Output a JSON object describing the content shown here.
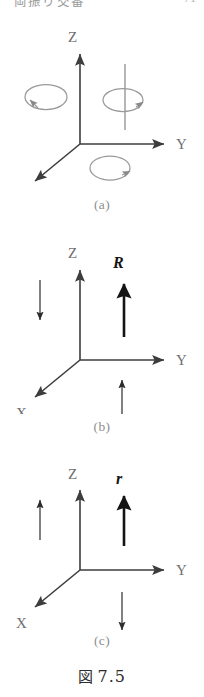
{
  "header": {
    "running_title": "両振り交番",
    "page_number": "71"
  },
  "figure": {
    "number_kanji": "図",
    "number": "7.5",
    "panels": [
      {
        "id": "a",
        "caption": "(a)",
        "axes": [
          {
            "name": "z-axis",
            "label": "Z",
            "direction": "up"
          },
          {
            "name": "y-axis",
            "label": "Y",
            "direction": "right"
          },
          {
            "name": "x-axis",
            "label": "X",
            "direction": "down-left"
          }
        ],
        "annotations": [
          {
            "name": "rotation-arrow-x",
            "glyph": "rotation-ellipse",
            "position": "left"
          },
          {
            "name": "rotation-arrow-z",
            "glyph": "rotation-ellipse-about-line",
            "position": "center"
          },
          {
            "name": "rotation-arrow-y",
            "glyph": "rotation-ellipse",
            "position": "below"
          }
        ]
      },
      {
        "id": "b",
        "caption": "(b)",
        "axes": [
          {
            "name": "z-axis",
            "label": "Z",
            "direction": "up"
          },
          {
            "name": "y-axis",
            "label": "Y",
            "direction": "right"
          },
          {
            "name": "x-axis",
            "label": "X",
            "direction": "down-left"
          }
        ],
        "vector": {
          "name": "vector-R",
          "label": "R",
          "direction": "up",
          "weight": "bold"
        },
        "annotations": [
          {
            "name": "thin-arrow-left",
            "glyph": "arrow",
            "direction": "down"
          },
          {
            "name": "thin-arrow-below",
            "glyph": "arrow",
            "direction": "up"
          }
        ]
      },
      {
        "id": "c",
        "caption": "(c)",
        "axes": [
          {
            "name": "z-axis",
            "label": "Z",
            "direction": "up"
          },
          {
            "name": "y-axis",
            "label": "Y",
            "direction": "right"
          },
          {
            "name": "x-axis",
            "label": "X",
            "direction": "down-left"
          }
        ],
        "vector": {
          "name": "vector-r",
          "label": "r",
          "direction": "up",
          "weight": "bold"
        },
        "annotations": [
          {
            "name": "thin-arrow-left",
            "glyph": "arrow",
            "direction": "up"
          },
          {
            "name": "thin-arrow-below",
            "glyph": "arrow",
            "direction": "down"
          }
        ]
      }
    ]
  },
  "colors": {
    "ink": "#2c2c2c",
    "axis": "#3d3d3d",
    "light_ink": "#7d7d7d",
    "caption": "#8e8e8e",
    "background": "#ffffff"
  }
}
